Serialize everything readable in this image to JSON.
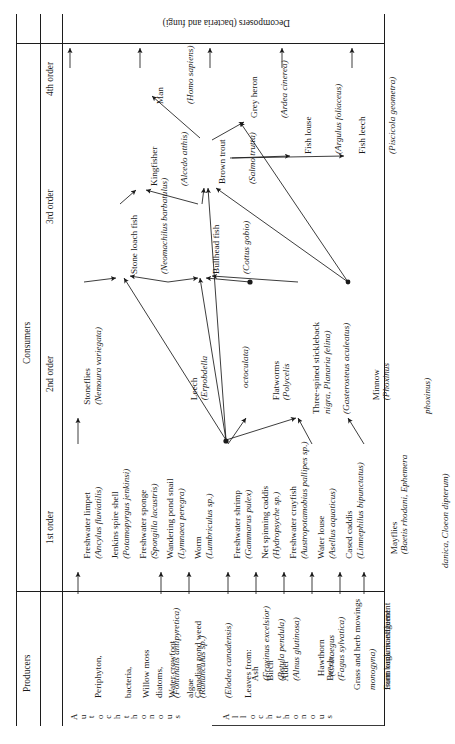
{
  "figure": {
    "title_producers": "Producers",
    "title_consumers": "Consumers",
    "decomposers": "Decomposers (bacteria and fungi)",
    "orders": [
      {
        "key": "o1",
        "label": "1st order"
      },
      {
        "key": "o2",
        "label": "2nd order"
      },
      {
        "key": "o3",
        "label": "3rd order"
      },
      {
        "key": "o4",
        "label": "4th order"
      }
    ],
    "producer_groups": [
      {
        "key": "auto",
        "letters": "Autochthonous"
      },
      {
        "key": "allo",
        "letters": "Allochthonous"
      }
    ]
  },
  "producers": {
    "autochthonous": [
      {
        "common": "Periphyton,",
        "line2": "bacteria,",
        "line3": "diatoms,",
        "line4": "algae",
        "latin": ""
      },
      {
        "common": "Willow moss",
        "latin": "(Fontinalis antipyretica)"
      },
      {
        "common": "Water crowfoot",
        "latin": "(Ranunculus sp.)"
      },
      {
        "common": "Canadian pond weed",
        "latin": "(Elodea canadensis)"
      }
    ],
    "allochthonous": [
      {
        "common": "Leaves from:",
        "latin": ""
      },
      {
        "common": "Ash",
        "latin": "(Fraxinus excelsior)"
      },
      {
        "common": "Birch",
        "latin": "(Betula pendula)"
      },
      {
        "common": "Alder",
        "latin": "(Alnus glutinosa)"
      },
      {
        "common": "Hawthorn",
        "latin": "(Crataegus",
        "latin2": "monogyna)"
      },
      {
        "common": "Beech",
        "latin": "(Fagus sylvatica)"
      },
      {
        "common": "Grass and herb mowings",
        "line2": "from bank management",
        "latin": ""
      },
      {
        "common": "Farm organic effluent",
        "latin": ""
      }
    ]
  },
  "consumers": {
    "first_order": [
      {
        "common": "Freshwater limpet",
        "latin": "(Ancylus fluviatilis)"
      },
      {
        "common": "Jenkins spire shell",
        "latin": "(Potamopyrgus jenkinsi)"
      },
      {
        "common": "Freshwater sponge",
        "latin": "(Spongilla lacustris)"
      },
      {
        "common": "Wandering pond snail",
        "latin": "(Lymnaea peregra)"
      },
      {
        "common": "Worm",
        "latin": "(Lumbriculus sp.)"
      },
      {
        "common": "Freshwater shrimp",
        "latin": "(Gammarus pulex)"
      },
      {
        "common": "Net spinning caddis",
        "latin": "(Hydropsyche sp.)"
      },
      {
        "common": "Freshwater crayfish",
        "latin": "(Austropotamobius pallipes sp.)"
      },
      {
        "common": "Water louse",
        "latin": "(Asellus aquaticus)"
      },
      {
        "common": "Cased caddis",
        "latin": "(Limnephilus bipunctatus)"
      },
      {
        "common": "Mayflies",
        "latin": "(Baetis rhodani, Ephemera",
        "latin2": "danica, Cloeon dipterum)"
      }
    ],
    "second_order": [
      {
        "common": "Stoneflies",
        "latin": "(Nemoura variegata)"
      },
      {
        "common": "Leech",
        "latin": "(Erpobdella",
        "latin2": "octoculata)"
      },
      {
        "common": "Flatworms",
        "latin": "(Polycelis",
        "latin2": "nigra, Planaria felina)"
      },
      {
        "common": "Three-spined stickleback",
        "latin": "(Gasterosteus aculeatus)"
      },
      {
        "common": "Minnow",
        "latin": "(Phoxinus",
        "latin2": "phoxinus)"
      }
    ],
    "third_order": [
      {
        "common": "Stone loach fish",
        "latin": "(Neomachilus barbatulus)"
      },
      {
        "common": "Bullhead fish",
        "latin": "(Cottus gobio)"
      },
      {
        "common": "Kingfisher",
        "latin": "(Alcedo atthis)"
      },
      {
        "common": "Brown trout",
        "latin": "(Salmo trutta)"
      },
      {
        "common": "Grey heron",
        "latin": "(Ardea cinerea)"
      },
      {
        "common": "Fish louse",
        "latin": "(Argulus foliaceus)"
      },
      {
        "common": "Fish leech",
        "latin": "(Piscicola geometra)"
      }
    ],
    "fourth_order": [
      {
        "common": "Man",
        "latin": "(Homo sapiens)"
      }
    ]
  },
  "colors": {
    "ink": "#1a1a1a",
    "rule": "#1c1c1c",
    "background": "#ffffff"
  }
}
